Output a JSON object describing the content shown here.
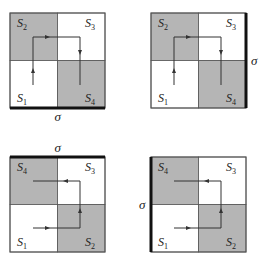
{
  "colors": {
    "shaded": "#b5b5b5",
    "white": "#ffffff",
    "border": "#555555",
    "path": "#333333",
    "sigma_bar": "#111111"
  },
  "sigma_label": "σ",
  "panels": [
    {
      "id": "top-left",
      "origin": [
        10,
        13
      ],
      "size": 95,
      "cells": {
        "top_left": {
          "label": "S",
          "sub": "2",
          "shaded": true
        },
        "top_right": {
          "label": "S",
          "sub": "3",
          "shaded": false
        },
        "bottom_left": {
          "label": "S",
          "sub": "1",
          "shaded": false
        },
        "bottom_right": {
          "label": "S",
          "sub": "4",
          "shaded": true
        }
      },
      "sigma_side": "bottom",
      "path": [
        [
          23,
          72
        ],
        [
          23,
          24
        ],
        [
          70,
          24
        ],
        [
          70,
          72
        ]
      ],
      "arrows": [
        {
          "at": [
            23,
            58
          ],
          "dir": "up"
        },
        {
          "at": [
            37,
            24
          ],
          "dir": "right"
        },
        {
          "at": [
            70,
            39
          ],
          "dir": "down"
        }
      ]
    },
    {
      "id": "top-right",
      "origin": [
        151,
        13
      ],
      "size": 95,
      "cells": {
        "top_left": {
          "label": "S",
          "sub": "2",
          "shaded": true
        },
        "top_right": {
          "label": "S",
          "sub": "3",
          "shaded": false
        },
        "bottom_left": {
          "label": "S",
          "sub": "1",
          "shaded": false
        },
        "bottom_right": {
          "label": "S",
          "sub": "4",
          "shaded": true
        }
      },
      "sigma_side": "right",
      "path": [
        [
          23,
          72
        ],
        [
          23,
          24
        ],
        [
          70,
          24
        ],
        [
          70,
          72
        ]
      ],
      "arrows": [
        {
          "at": [
            23,
            58
          ],
          "dir": "up"
        },
        {
          "at": [
            37,
            24
          ],
          "dir": "right"
        },
        {
          "at": [
            70,
            39
          ],
          "dir": "down"
        }
      ]
    },
    {
      "id": "bottom-left",
      "origin": [
        10,
        157
      ],
      "size": 95,
      "cells": {
        "top_left": {
          "label": "S",
          "sub": "4",
          "shaded": true
        },
        "top_right": {
          "label": "S",
          "sub": "3",
          "shaded": false
        },
        "bottom_left": {
          "label": "S",
          "sub": "1",
          "shaded": false
        },
        "bottom_right": {
          "label": "S",
          "sub": "2",
          "shaded": true
        }
      },
      "sigma_side": "top",
      "path": [
        [
          23,
          71
        ],
        [
          70,
          71
        ],
        [
          70,
          24
        ],
        [
          23,
          24
        ]
      ],
      "arrows": [
        {
          "at": [
            37,
            71
          ],
          "dir": "right"
        },
        {
          "at": [
            70,
            54
          ],
          "dir": "up"
        },
        {
          "at": [
            56,
            24
          ],
          "dir": "left"
        }
      ]
    },
    {
      "id": "bottom-right",
      "origin": [
        151,
        157
      ],
      "size": 95,
      "cells": {
        "top_left": {
          "label": "S",
          "sub": "4",
          "shaded": true
        },
        "top_right": {
          "label": "S",
          "sub": "3",
          "shaded": false
        },
        "bottom_left": {
          "label": "S",
          "sub": "1",
          "shaded": false
        },
        "bottom_right": {
          "label": "S",
          "sub": "2",
          "shaded": true
        }
      },
      "sigma_side": "left",
      "path": [
        [
          23,
          71
        ],
        [
          70,
          71
        ],
        [
          70,
          24
        ],
        [
          23,
          24
        ]
      ],
      "arrows": [
        {
          "at": [
            37,
            71
          ],
          "dir": "right"
        },
        {
          "at": [
            70,
            54
          ],
          "dir": "up"
        },
        {
          "at": [
            56,
            24
          ],
          "dir": "left"
        }
      ]
    }
  ]
}
